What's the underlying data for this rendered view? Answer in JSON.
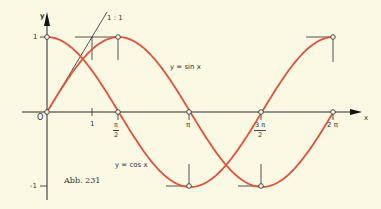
{
  "figure": {
    "caption": "Abb. 231",
    "axes": {
      "x_label": "x",
      "y_label": "y",
      "origin_label": "O",
      "y_ticks": [
        "1",
        "-1"
      ],
      "x_ticks": [
        {
          "label": "1"
        },
        {
          "num": "π",
          "den": "2"
        },
        {
          "label": "π"
        },
        {
          "num": "3 π",
          "den": "2"
        },
        {
          "label": "2 π"
        }
      ]
    },
    "curves": {
      "sin_label": "y = sin x",
      "cos_label": "y = cos x",
      "slope_label": "1 : 1"
    },
    "colors": {
      "background": "#fbf8e4",
      "curve": "#e2513a",
      "axis": "#2a2a2a"
    }
  },
  "chart_data": {
    "type": "line",
    "title": "Abb. 231",
    "xlabel": "x",
    "ylabel": "y",
    "x_ticks": [
      "1",
      "π/2",
      "π",
      "3π/2",
      "2π"
    ],
    "y_ticks": [
      -1,
      1
    ],
    "xlim": [
      0,
      6.9
    ],
    "ylim": [
      -1,
      1
    ],
    "series": [
      {
        "name": "y = sin x",
        "x": [
          0,
          1.5708,
          3.1416,
          4.7124,
          6.2832
        ],
        "values": [
          0,
          1,
          0,
          -1,
          0
        ]
      },
      {
        "name": "y = cos x",
        "x": [
          0,
          1.5708,
          3.1416,
          4.7124,
          6.2832
        ],
        "values": [
          1,
          0,
          -1,
          0,
          1
        ]
      },
      {
        "name": "tangent 1 : 1 at origin",
        "x": [
          0,
          1
        ],
        "values": [
          0,
          1
        ]
      }
    ],
    "annotations": [
      "1 : 1",
      "y = sin x",
      "y = cos x",
      "O"
    ]
  }
}
